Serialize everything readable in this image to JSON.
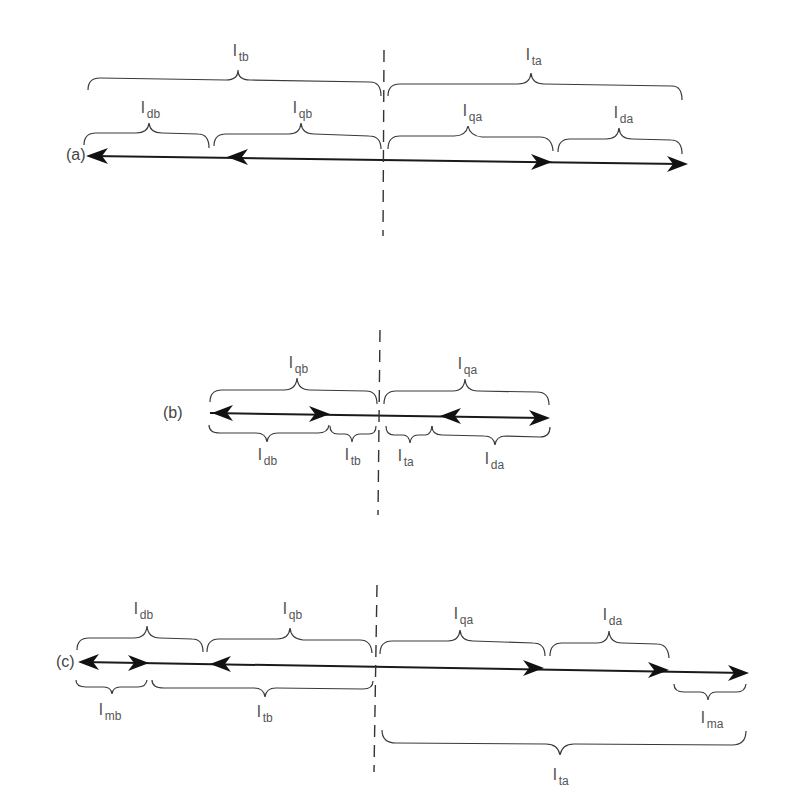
{
  "colors": {
    "background": "#ffffff",
    "line": "#1a1a1a",
    "text": "#555555"
  },
  "panels": [
    {
      "id": "a",
      "label": "(a)",
      "braces_above": [
        {
          "main": "l",
          "sub": "tb",
          "tier": "outer"
        },
        {
          "main": "l",
          "sub": "ta",
          "tier": "outer"
        },
        {
          "main": "l",
          "sub": "db",
          "tier": "inner"
        },
        {
          "main": "l",
          "sub": "qb",
          "tier": "inner"
        },
        {
          "main": "l",
          "sub": "qa",
          "tier": "inner"
        },
        {
          "main": "l",
          "sub": "da",
          "tier": "inner"
        }
      ],
      "braces_below": [],
      "arrowheads": [
        "left at far-left end",
        "left at l_db/l_qb boundary",
        "right at l_qa/l_da boundary",
        "right at far-right end"
      ]
    },
    {
      "id": "b",
      "label": "(b)",
      "braces_above": [
        {
          "main": "l",
          "sub": "qb"
        },
        {
          "main": "l",
          "sub": "qa"
        }
      ],
      "braces_below": [
        {
          "main": "l",
          "sub": "db"
        },
        {
          "main": "l",
          "sub": "tb"
        },
        {
          "main": "l",
          "sub": "ta"
        },
        {
          "main": "l",
          "sub": "da"
        }
      ],
      "arrowheads": [
        "left at far-left end",
        "right at l_db/l_tb boundary",
        "left at l_ta/l_da boundary",
        "right at far-right end"
      ]
    },
    {
      "id": "c",
      "label": "(c)",
      "braces_above": [
        {
          "main": "l",
          "sub": "db"
        },
        {
          "main": "l",
          "sub": "qb"
        },
        {
          "main": "l",
          "sub": "qa"
        },
        {
          "main": "l",
          "sub": "da"
        }
      ],
      "braces_below": [
        {
          "main": "l",
          "sub": "mb"
        },
        {
          "main": "l",
          "sub": "tb"
        },
        {
          "main": "l",
          "sub": "ma"
        },
        {
          "main": "l",
          "sub": "ta"
        }
      ],
      "arrowheads": [
        "left at far-left end",
        "right at l_mb/l_tb boundary",
        "left at l_db/l_qb boundary",
        "right at l_qa/l_da boundary",
        "right at l_da/l_ma boundary",
        "right at far-right end"
      ]
    }
  ],
  "labels": {
    "a": {
      "panel": "(a)",
      "tb": "tb",
      "ta": "ta",
      "db": "db",
      "qb": "qb",
      "qa": "qa",
      "da": "da"
    },
    "b": {
      "panel": "(b)",
      "qb": "qb",
      "qa": "qa",
      "db": "db",
      "tb": "tb",
      "ta": "ta",
      "da": "da"
    },
    "c": {
      "panel": "(c)",
      "db": "db",
      "qb": "qb",
      "qa": "qa",
      "da": "da",
      "mb": "mb",
      "tb": "tb",
      "ma": "ma",
      "ta": "ta"
    },
    "main_symbol": "l"
  },
  "divider": {
    "style": "dashed vertical line",
    "x_description": "center dividing line between before (b) and after (a) sides"
  }
}
